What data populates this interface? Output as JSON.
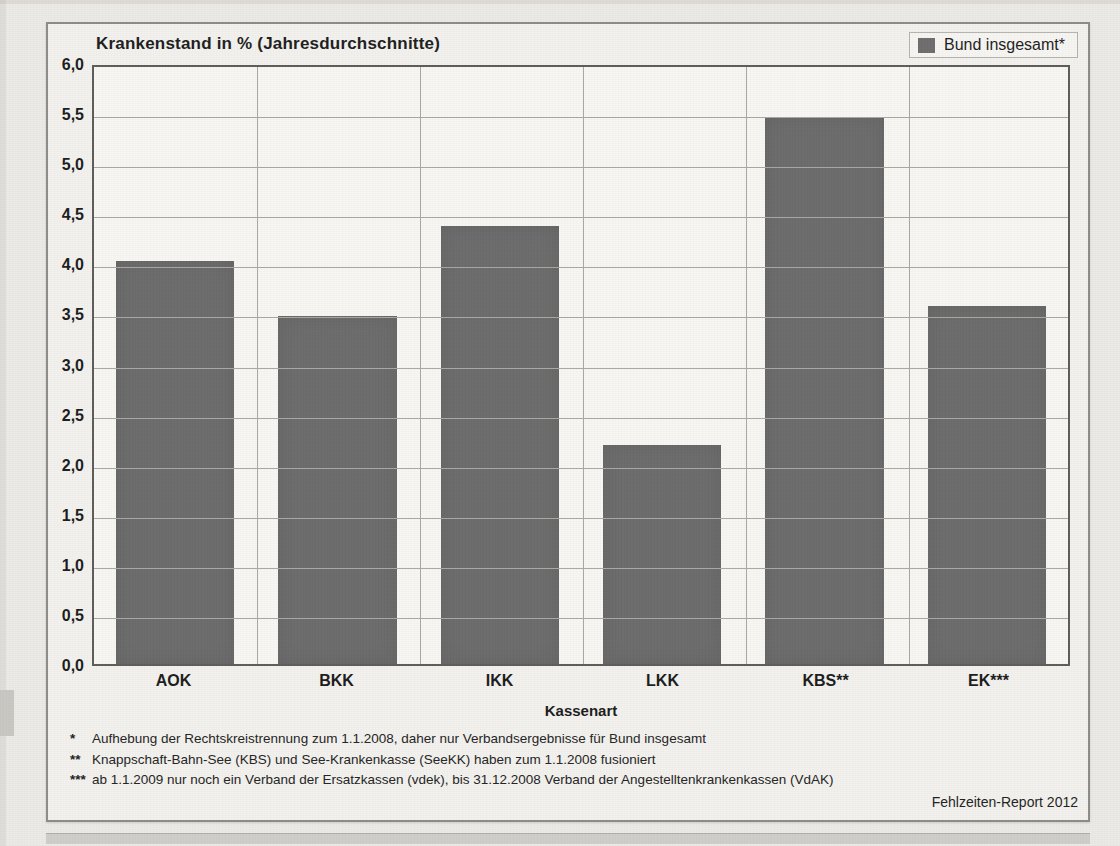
{
  "chart_data": {
    "type": "bar",
    "title": "Krankenstand in %  (Jahresdurchschnitte)",
    "xlabel": "Kassenart",
    "ylabel": "",
    "ylim": [
      0,
      6
    ],
    "ytick_step": 0.5,
    "grid": true,
    "legend_position": "top-right",
    "categories": [
      "AOK",
      "BKK",
      "IKK",
      "LKK",
      "KBS**",
      "EK***"
    ],
    "values": [
      4.05,
      3.5,
      4.4,
      2.2,
      5.5,
      3.6
    ],
    "series": [
      {
        "name": "Bund insgesamt*",
        "color": "#6b6b6b",
        "values": [
          4.05,
          3.5,
          4.4,
          2.2,
          5.5,
          3.6
        ]
      }
    ],
    "ytick_labels": [
      "6,0",
      "5,5",
      "5,0",
      "4,5",
      "4,0",
      "3,5",
      "3,0",
      "2,5",
      "2,0",
      "1,5",
      "1,0",
      "0,5",
      "0,0"
    ],
    "ytick_values": [
      6.0,
      5.5,
      5.0,
      4.5,
      4.0,
      3.5,
      3.0,
      2.5,
      2.0,
      1.5,
      1.0,
      0.5,
      0.0
    ]
  },
  "legend": {
    "label": "Bund insgesamt*",
    "swatch_color": "#6b6b6b"
  },
  "footnotes": [
    {
      "mark": "*",
      "text": "Aufhebung der Rechtskreistrennung zum 1.1.2008, daher nur Verbandsergebnisse für Bund insgesamt"
    },
    {
      "mark": "**",
      "text": "Knappschaft-Bahn-See (KBS) und See-Krankenkasse (SeeKK) haben zum 1.1.2008 fusioniert"
    },
    {
      "mark": "***",
      "text": "ab 1.1.2009 nur noch ein Verband der Ersatzkassen (vdek), bis 31.12.2008 Verband der Angestelltenkrankenkassen (VdAK)"
    }
  ],
  "source": "Fehlzeiten-Report 2012",
  "background_text": [
    {
      "text": "der Krankenstand lag im Jahr",
      "x": 118,
      "y": 92
    },
    {
      "text": "in den einzelnen Kassenarten",
      "x": 430,
      "y": 92
    },
    {
      "text": "zwischen den Kassenarten",
      "x": 760,
      "y": 92
    },
    {
      "text": "Verteilung  nach  Kassenart",
      "x": 150,
      "y": 152
    },
    {
      "text": "gegenüber dem Vorjahr",
      "x": 520,
      "y": 152
    },
    {
      "text": "Krankenstandes ist",
      "x": 800,
      "y": 152
    },
    {
      "text": "Beschäftigten",
      "x": 120,
      "y": 210
    },
    {
      "text": "in der Statistik",
      "x": 560,
      "y": 210
    },
    {
      "text": "Anteil der",
      "x": 880,
      "y": 210
    },
    {
      "text": "die Ergebnisse der",
      "x": 60,
      "y": 700
    },
    {
      "text": "einzelnen Krankenkassen sind nur bedingt vergleichbar",
      "x": 330,
      "y": 700
    }
  ]
}
